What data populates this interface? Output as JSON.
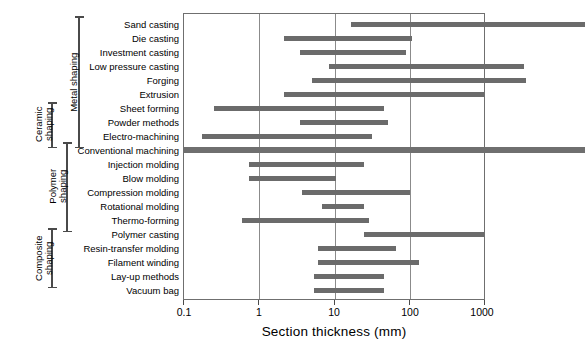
{
  "chart_data": {
    "type": "bar",
    "orientation": "horizontal",
    "title": "",
    "xlabel": "Section thickness  (mm)",
    "ylabel": "",
    "xscale": "log",
    "xlim": [
      0.1,
      1000
    ],
    "xticks": [
      "0.1",
      "1",
      "10",
      "100",
      "1000"
    ],
    "xtickvalues": [
      0.1,
      1,
      10,
      100,
      1000
    ],
    "grid": "vertical",
    "legend": "none",
    "categories": [
      "Sand casting",
      "Die casting",
      "Investment casting",
      "Low pressure casting",
      "Forging",
      "Extrusion",
      "Sheet forming",
      "Powder methods",
      "Electro-machining",
      "Conventional machining",
      "Injection molding",
      "Blow molding",
      "Compression molding",
      "Rotational molding",
      "Thermo-forming",
      "Polymer casting",
      "Resin-transfer molding",
      "Filament winding",
      "Lay-up methods",
      "Vacuum bag"
    ],
    "ranges": [
      {
        "label": "Sand casting",
        "min": 4.6,
        "max": 1000
      },
      {
        "label": "Die casting",
        "min": 1.0,
        "max": 19
      },
      {
        "label": "Investment casting",
        "min": 1.45,
        "max": 16.5
      },
      {
        "label": "Low pressure casting",
        "min": 2.8,
        "max": 250
      },
      {
        "label": "Forging",
        "min": 1.9,
        "max": 260
      },
      {
        "label": "Extrusion",
        "min": 1.0,
        "max": 100
      },
      {
        "label": "Sheet forming",
        "min": 0.2,
        "max": 10
      },
      {
        "label": "Powder methods",
        "min": 1.45,
        "max": 11
      },
      {
        "label": "Electro-machining",
        "min": 0.15,
        "max": 7.5
      },
      {
        "label": "Conventional machining",
        "min": 0.1,
        "max": 1000
      },
      {
        "label": "Injection molding",
        "min": 0.45,
        "max": 6.2
      },
      {
        "label": "Blow molding",
        "min": 0.45,
        "max": 3.3
      },
      {
        "label": "Compression molding",
        "min": 1.5,
        "max": 18
      },
      {
        "label": "Rotational molding",
        "min": 2.4,
        "max": 6.2
      },
      {
        "label": "Thermo-forming",
        "min": 0.38,
        "max": 7.0
      },
      {
        "label": "Polymer casting",
        "min": 6.3,
        "max": 100
      },
      {
        "label": "Resin-transfer molding",
        "min": 2.2,
        "max": 13
      },
      {
        "label": "Filament winding",
        "min": 2.2,
        "max": 22
      },
      {
        "label": "Lay-up methods",
        "min": 2.0,
        "max": 10
      },
      {
        "label": "Vacuum bag",
        "min": 2.0,
        "max": 10
      }
    ],
    "groups": [
      {
        "name": "Metal shaping",
        "first": "Sand casting",
        "last": "Conventional machining"
      },
      {
        "name": "Ceramic shaping",
        "first": "Powder methods",
        "last": "Conventional machining"
      },
      {
        "name": "Polymer shaping",
        "first": "Injection molding",
        "last": "Polymer casting"
      },
      {
        "name": "Composite shaping",
        "first": "Resin-transfer molding",
        "last": "Vacuum bag"
      }
    ],
    "colors": {
      "bar": "#6b6b6b",
      "frame": "#6f6f6f",
      "grid": "#8b8b8b",
      "bracket": "#4a4a4a",
      "background": "#ffffff",
      "text": "#000000"
    }
  },
  "groups": {
    "metal": "Metal shaping",
    "ceramic_l1": "Ceramic",
    "ceramic_l2": "shaping",
    "polymer_l1": "Polymer",
    "polymer_l2": "shaping",
    "composite_l1": "Composite",
    "composite_l2": "shaping"
  },
  "axis": {
    "title": "Section thickness  (mm)",
    "t0": "0.1",
    "t1": "1",
    "t2": "10",
    "t3": "100",
    "t4": "1000"
  }
}
